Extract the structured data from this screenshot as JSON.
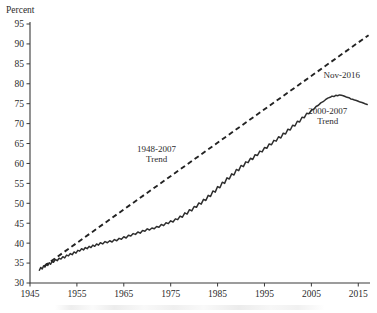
{
  "chart_data": {
    "type": "line",
    "title": "",
    "xlabel": "",
    "ylabel": "Percent",
    "ylim": [
      30,
      95
    ],
    "xlim": [
      1945,
      2017.5
    ],
    "y_ticks": [
      30,
      35,
      40,
      45,
      50,
      55,
      60,
      65,
      70,
      75,
      80,
      85,
      90,
      95
    ],
    "x_ticks": [
      1945,
      1955,
      1965,
      1975,
      1985,
      1995,
      2005,
      2015
    ],
    "grid": false,
    "legend_position": "none",
    "annotations": [
      {
        "id": "trend-1948-2007",
        "line1": "1948-2007",
        "line2": "Trend",
        "x": 1972.0,
        "y": 63.0
      },
      {
        "id": "nov-2016",
        "line1": "Nov-2016",
        "line2": "",
        "x": 2011.5,
        "y": 81.5
      },
      {
        "id": "trend-2000-2007",
        "line1": "2000-2007",
        "line2": "Trend",
        "x": 2008.5,
        "y": 72.5
      }
    ],
    "series": [
      {
        "name": "Observed",
        "style": "solid",
        "color": "#2e2e2e",
        "points": [
          [
            1947.0,
            33.2
          ],
          [
            1947.3,
            33.9
          ],
          [
            1947.6,
            33.5
          ],
          [
            1947.9,
            34.3
          ],
          [
            1948.2,
            34.0
          ],
          [
            1948.5,
            34.8
          ],
          [
            1948.8,
            34.4
          ],
          [
            1949.1,
            35.1
          ],
          [
            1949.4,
            34.7
          ],
          [
            1949.7,
            35.4
          ],
          [
            1950.0,
            35.2
          ],
          [
            1950.4,
            35.9
          ],
          [
            1950.8,
            35.6
          ],
          [
            1951.2,
            36.2
          ],
          [
            1951.6,
            36.0
          ],
          [
            1952.0,
            36.6
          ],
          [
            1952.4,
            36.3
          ],
          [
            1952.8,
            37.0
          ],
          [
            1953.2,
            36.8
          ],
          [
            1953.6,
            37.4
          ],
          [
            1954.0,
            37.1
          ],
          [
            1954.4,
            37.8
          ],
          [
            1954.8,
            37.5
          ],
          [
            1955.2,
            38.2
          ],
          [
            1955.6,
            38.0
          ],
          [
            1956.0,
            38.6
          ],
          [
            1956.4,
            38.3
          ],
          [
            1956.8,
            38.9
          ],
          [
            1957.2,
            38.6
          ],
          [
            1957.6,
            39.2
          ],
          [
            1958.0,
            38.9
          ],
          [
            1958.4,
            39.5
          ],
          [
            1958.8,
            39.2
          ],
          [
            1959.2,
            39.8
          ],
          [
            1959.6,
            39.5
          ],
          [
            1960.0,
            40.1
          ],
          [
            1960.5,
            39.8
          ],
          [
            1961.0,
            40.4
          ],
          [
            1961.5,
            40.1
          ],
          [
            1962.0,
            40.6
          ],
          [
            1962.5,
            40.3
          ],
          [
            1963.0,
            40.9
          ],
          [
            1963.5,
            40.6
          ],
          [
            1964.0,
            41.2
          ],
          [
            1964.5,
            41.0
          ],
          [
            1965.0,
            41.6
          ],
          [
            1965.5,
            41.3
          ],
          [
            1966.0,
            42.0
          ],
          [
            1966.5,
            41.8
          ],
          [
            1967.0,
            42.4
          ],
          [
            1967.5,
            42.2
          ],
          [
            1968.0,
            42.8
          ],
          [
            1968.5,
            42.5
          ],
          [
            1969.0,
            43.2
          ],
          [
            1969.5,
            43.0
          ],
          [
            1970.0,
            43.6
          ],
          [
            1970.5,
            43.3
          ],
          [
            1971.0,
            43.8
          ],
          [
            1971.5,
            43.6
          ],
          [
            1972.0,
            44.2
          ],
          [
            1972.5,
            44.0
          ],
          [
            1973.0,
            44.7
          ],
          [
            1973.5,
            44.4
          ],
          [
            1974.0,
            45.1
          ],
          [
            1974.5,
            44.9
          ],
          [
            1975.0,
            45.6
          ],
          [
            1975.5,
            45.3
          ],
          [
            1976.0,
            46.1
          ],
          [
            1976.5,
            45.9
          ],
          [
            1977.0,
            46.8
          ],
          [
            1977.5,
            46.5
          ],
          [
            1978.0,
            47.6
          ],
          [
            1978.5,
            47.3
          ],
          [
            1979.0,
            48.4
          ],
          [
            1979.5,
            48.1
          ],
          [
            1980.0,
            49.2
          ],
          [
            1980.5,
            49.0
          ],
          [
            1981.0,
            50.1
          ],
          [
            1981.5,
            49.8
          ],
          [
            1982.0,
            51.0
          ],
          [
            1982.5,
            50.7
          ],
          [
            1983.0,
            52.0
          ],
          [
            1983.5,
            51.7
          ],
          [
            1984.0,
            53.1
          ],
          [
            1984.5,
            52.8
          ],
          [
            1985.0,
            54.2
          ],
          [
            1985.5,
            53.9
          ],
          [
            1986.0,
            55.3
          ],
          [
            1986.5,
            55.0
          ],
          [
            1987.0,
            56.4
          ],
          [
            1987.5,
            56.1
          ],
          [
            1988.0,
            57.4
          ],
          [
            1988.5,
            57.1
          ],
          [
            1989.0,
            58.5
          ],
          [
            1989.5,
            58.2
          ],
          [
            1990.0,
            59.5
          ],
          [
            1990.5,
            59.2
          ],
          [
            1991.0,
            60.4
          ],
          [
            1991.5,
            60.2
          ],
          [
            1992.0,
            61.3
          ],
          [
            1992.5,
            61.0
          ],
          [
            1993.0,
            62.2
          ],
          [
            1993.5,
            62.0
          ],
          [
            1994.0,
            63.1
          ],
          [
            1994.5,
            62.9
          ],
          [
            1995.0,
            64.0
          ],
          [
            1995.5,
            63.8
          ],
          [
            1996.0,
            64.9
          ],
          [
            1996.5,
            64.7
          ],
          [
            1997.0,
            65.8
          ],
          [
            1997.5,
            65.6
          ],
          [
            1998.0,
            66.7
          ],
          [
            1998.5,
            66.4
          ],
          [
            1999.0,
            67.6
          ],
          [
            1999.5,
            67.4
          ],
          [
            2000.0,
            68.6
          ],
          [
            2000.5,
            68.4
          ],
          [
            2001.0,
            69.6
          ],
          [
            2001.5,
            69.4
          ],
          [
            2002.0,
            70.6
          ],
          [
            2002.5,
            70.4
          ],
          [
            2003.0,
            71.6
          ],
          [
            2003.5,
            71.5
          ],
          [
            2004.0,
            72.6
          ],
          [
            2004.5,
            72.5
          ],
          [
            2005.0,
            73.4
          ],
          [
            2005.5,
            73.6
          ],
          [
            2006.0,
            74.3
          ],
          [
            2006.5,
            74.6
          ],
          [
            2007.0,
            75.2
          ],
          [
            2007.5,
            75.5
          ],
          [
            2008.0,
            76.0
          ],
          [
            2008.5,
            76.4
          ],
          [
            2009.0,
            76.6
          ],
          [
            2009.4,
            76.9
          ],
          [
            2009.8,
            76.8
          ],
          [
            2010.2,
            77.1
          ],
          [
            2010.6,
            77.0
          ],
          [
            2011.0,
            77.2
          ],
          [
            2011.4,
            77.1
          ],
          [
            2011.8,
            77.0
          ],
          [
            2012.2,
            76.8
          ],
          [
            2012.6,
            76.6
          ],
          [
            2013.0,
            76.5
          ],
          [
            2013.4,
            76.2
          ],
          [
            2013.8,
            76.1
          ],
          [
            2014.2,
            75.9
          ],
          [
            2014.6,
            75.8
          ],
          [
            2015.0,
            75.6
          ],
          [
            2015.4,
            75.4
          ],
          [
            2015.8,
            75.3
          ],
          [
            2016.2,
            75.1
          ],
          [
            2016.6,
            74.9
          ],
          [
            2016.9,
            74.8
          ]
        ]
      },
      {
        "name": "1948-2007 Trend",
        "style": "dashed",
        "color": "#232323",
        "points": [
          [
            1948.0,
            34.2
          ],
          [
            2017.2,
            92.2
          ]
        ]
      }
    ]
  },
  "axis": {
    "y_title": "Percent"
  }
}
